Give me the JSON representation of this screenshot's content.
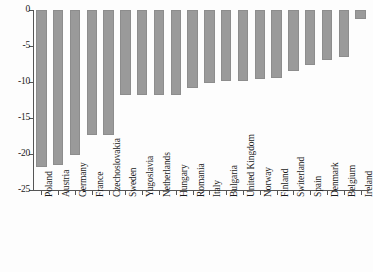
{
  "chart_data": {
    "type": "bar",
    "title": "",
    "subtitle": "",
    "xlabel": "",
    "ylabel": "",
    "orientation": "vertical",
    "grid": false,
    "legend": null,
    "bar_color": "#9a9a9a",
    "axis_color": "#555555",
    "background_color": "#fdfdfd",
    "ylim": [
      -25,
      0
    ],
    "yticks": [
      0,
      -5,
      -10,
      -15,
      -20,
      -25
    ],
    "ytick_labels": [
      "0",
      "-5",
      "-10",
      "-15",
      "-20",
      "-25"
    ],
    "categories": [
      "Poland",
      "Austria",
      "Germany",
      "France",
      "Czechoslovakia",
      "Sweden",
      "Yugoslavia",
      "Netherlands",
      "Hungary",
      "Romania",
      "Italy",
      "Bulgaria",
      "United Kingdom",
      "Norway",
      "Finland",
      "Switerland",
      "Spain",
      "Denmark",
      "Belgium",
      "Ireland"
    ],
    "values": [
      -21.8,
      -21.5,
      -20.1,
      -17.3,
      -17.3,
      -11.8,
      -11.8,
      -11.8,
      -11.8,
      -10.8,
      -10.2,
      -9.9,
      -9.9,
      -9.6,
      -9.4,
      -8.5,
      -7.7,
      -7.0,
      -6.5,
      -1.3
    ]
  }
}
